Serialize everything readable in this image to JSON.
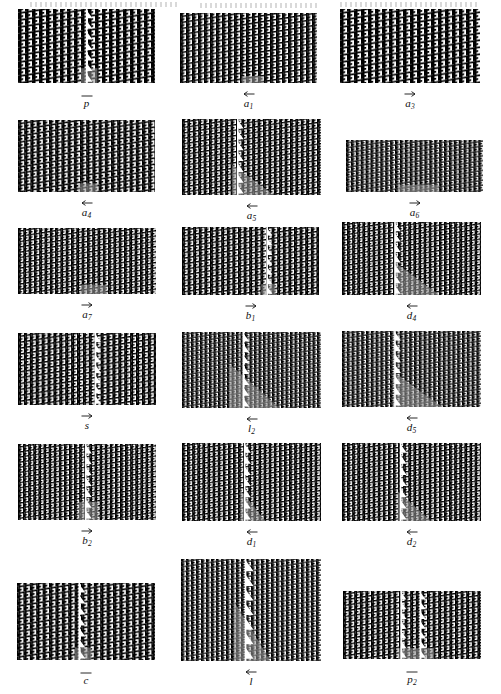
{
  "figure": {
    "type": "tiling-patch-grid",
    "columns": 3,
    "rows": 6,
    "background_color": "#ffffff",
    "tile_color": "#000000",
    "highlight_color": "#9d9d9d",
    "fault_highlight_color": "#b5b5b5",
    "panels": [
      {
        "id": "panel-p-bar",
        "label": "p",
        "subscript": "",
        "accent": "bar",
        "col": 0,
        "row": 0,
        "x": 18,
        "y": 9,
        "w": 137,
        "h": 74,
        "cell": 7.0,
        "fault": {
          "present": true,
          "x_frac": 0.5,
          "style": "vertical-white-triangles"
        },
        "highlight": {
          "present": true,
          "shape": "block",
          "x_frac": 0.46,
          "y_frac": 0.8,
          "w_frac": 0.12,
          "h_frac": 0.2
        }
      },
      {
        "id": "panel-a1",
        "label": "a",
        "subscript": "1",
        "accent": "left",
        "col": 1,
        "row": 0,
        "x": 180,
        "y": 13,
        "w": 137,
        "h": 70,
        "cell": 6.0,
        "fault": {
          "present": false
        },
        "highlight": {
          "present": true,
          "shape": "strip",
          "x_frac": 0.45,
          "y_frac": 0.9,
          "w_frac": 0.16,
          "h_frac": 0.1
        }
      },
      {
        "id": "panel-a3",
        "label": "a",
        "subscript": "3",
        "accent": "right",
        "col": 2,
        "row": 0,
        "x": 340,
        "y": 9,
        "w": 140,
        "h": 74,
        "cell": 7.0,
        "fault": {
          "present": false
        },
        "highlight": {
          "present": false
        }
      },
      {
        "id": "panel-a4",
        "label": "a",
        "subscript": "4",
        "accent": "left",
        "col": 0,
        "row": 1,
        "x": 18,
        "y": 120,
        "w": 137,
        "h": 72,
        "cell": 6.2,
        "fault": {
          "present": false
        },
        "highlight": {
          "present": true,
          "shape": "strip",
          "x_frac": 0.44,
          "y_frac": 0.88,
          "w_frac": 0.14,
          "h_frac": 0.12
        }
      },
      {
        "id": "panel-a5",
        "label": "a",
        "subscript": "5",
        "accent": "left",
        "col": 1,
        "row": 1,
        "x": 182,
        "y": 119,
        "w": 139,
        "h": 76,
        "cell": 5.4,
        "fault": {
          "present": true,
          "x_frac": 0.4,
          "style": "vertical-white-triangles"
        },
        "highlight": {
          "present": true,
          "shape": "triangle",
          "x_frac": 0.36,
          "y_frac": 0.6,
          "w_frac": 0.3,
          "h_frac": 0.4
        }
      },
      {
        "id": "panel-a6",
        "label": "a",
        "subscript": "6",
        "accent": "right",
        "col": 2,
        "row": 1,
        "x": 346,
        "y": 140,
        "w": 137,
        "h": 52,
        "cell": 4.9,
        "fault": {
          "present": false
        },
        "highlight": {
          "present": true,
          "shape": "strip",
          "x_frac": 0.38,
          "y_frac": 0.86,
          "w_frac": 0.3,
          "h_frac": 0.14
        }
      },
      {
        "id": "panel-a7",
        "label": "a",
        "subscript": "7",
        "accent": "right",
        "col": 0,
        "row": 2,
        "x": 18,
        "y": 228,
        "w": 138,
        "h": 66,
        "cell": 5.3,
        "fault": {
          "present": false
        },
        "highlight": {
          "present": true,
          "shape": "strip",
          "x_frac": 0.46,
          "y_frac": 0.86,
          "w_frac": 0.18,
          "h_frac": 0.14
        }
      },
      {
        "id": "panel-b1",
        "label": "b",
        "subscript": "1",
        "accent": "right",
        "col": 1,
        "row": 2,
        "x": 182,
        "y": 227,
        "w": 137,
        "h": 68,
        "cell": 5.6,
        "fault": {
          "present": true,
          "x_frac": 0.62,
          "style": "vertical-white-triangles"
        },
        "highlight": {
          "present": true,
          "shape": "block",
          "x_frac": 0.58,
          "y_frac": 0.84,
          "w_frac": 0.1,
          "h_frac": 0.16
        }
      },
      {
        "id": "panel-d4",
        "label": "d",
        "subscript": "4",
        "accent": "left",
        "col": 2,
        "row": 2,
        "x": 342,
        "y": 222,
        "w": 139,
        "h": 73,
        "cell": 5.1,
        "fault": {
          "present": true,
          "x_frac": 0.38,
          "style": "vertical-white-triangles"
        },
        "highlight": {
          "present": true,
          "shape": "triangle",
          "x_frac": 0.38,
          "y_frac": 0.55,
          "w_frac": 0.32,
          "h_frac": 0.45
        }
      },
      {
        "id": "panel-s",
        "label": "s",
        "subscript": "",
        "accent": "right",
        "col": 0,
        "row": 3,
        "x": 18,
        "y": 333,
        "w": 138,
        "h": 72,
        "cell": 5.9,
        "fault": {
          "present": true,
          "x_frac": 0.56,
          "style": "vertical-white-triangles"
        },
        "highlight": {
          "present": false
        }
      },
      {
        "id": "panel-l2",
        "label": "l",
        "subscript": "2",
        "accent": "left",
        "col": 1,
        "row": 3,
        "x": 182,
        "y": 332,
        "w": 139,
        "h": 76,
        "cell": 4.5,
        "fault": {
          "present": true,
          "x_frac": 0.44,
          "style": "vertical-white-triangles"
        },
        "highlight": {
          "present": true,
          "shape": "triangle",
          "x_frac": 0.34,
          "y_frac": 0.42,
          "w_frac": 0.36,
          "h_frac": 0.58
        }
      },
      {
        "id": "panel-d5",
        "label": "d",
        "subscript": "5",
        "accent": "left",
        "col": 2,
        "row": 3,
        "x": 342,
        "y": 331,
        "w": 139,
        "h": 76,
        "cell": 4.8,
        "fault": {
          "present": true,
          "x_frac": 0.38,
          "style": "vertical-white-triangles"
        },
        "highlight": {
          "present": true,
          "shape": "triangle",
          "x_frac": 0.38,
          "y_frac": 0.55,
          "w_frac": 0.34,
          "h_frac": 0.45
        }
      },
      {
        "id": "panel-b2",
        "label": "b",
        "subscript": "2",
        "accent": "right",
        "col": 0,
        "row": 4,
        "x": 18,
        "y": 444,
        "w": 138,
        "h": 76,
        "cell": 5.1,
        "fault": {
          "present": true,
          "x_frac": 0.49,
          "style": "vertical-white-triangles"
        },
        "highlight": {
          "present": true,
          "shape": "block",
          "x_frac": 0.44,
          "y_frac": 0.76,
          "w_frac": 0.14,
          "h_frac": 0.24
        }
      },
      {
        "id": "panel-d1",
        "label": "d",
        "subscript": "1",
        "accent": "left",
        "col": 1,
        "row": 4,
        "x": 182,
        "y": 443,
        "w": 139,
        "h": 78,
        "cell": 5.1,
        "fault": {
          "present": true,
          "x_frac": 0.45,
          "style": "vertical-white-triangles"
        },
        "highlight": {
          "present": true,
          "shape": "triangle",
          "x_frac": 0.42,
          "y_frac": 0.6,
          "w_frac": 0.18,
          "h_frac": 0.4
        }
      },
      {
        "id": "panel-d2",
        "label": "d",
        "subscript": "2",
        "accent": "left",
        "col": 2,
        "row": 4,
        "x": 342,
        "y": 443,
        "w": 139,
        "h": 78,
        "cell": 5.1,
        "fault": {
          "present": true,
          "x_frac": 0.42,
          "style": "vertical-white-triangles"
        },
        "highlight": {
          "present": true,
          "shape": "triangle",
          "x_frac": 0.4,
          "y_frac": 0.62,
          "w_frac": 0.24,
          "h_frac": 0.38
        }
      },
      {
        "id": "panel-c-bar",
        "label": "c",
        "subscript": "",
        "accent": "bar",
        "col": 0,
        "row": 5,
        "x": 17,
        "y": 583,
        "w": 138,
        "h": 77,
        "cell": 6.4,
        "fault": {
          "present": true,
          "x_frac": 0.45,
          "style": "vertical-white-triangles"
        },
        "highlight": {
          "present": true,
          "shape": "block",
          "x_frac": 0.42,
          "y_frac": 0.84,
          "w_frac": 0.12,
          "h_frac": 0.16
        }
      },
      {
        "id": "panel-l",
        "label": "l",
        "subscript": "",
        "accent": "left",
        "col": 1,
        "row": 5,
        "x": 181,
        "y": 559,
        "w": 140,
        "h": 102,
        "cell": 5.0,
        "fault": {
          "present": true,
          "x_frac": 0.46,
          "style": "vertical-white-triangles"
        },
        "highlight": {
          "present": true,
          "shape": "triangle",
          "x_frac": 0.38,
          "y_frac": 0.42,
          "w_frac": 0.26,
          "h_frac": 0.58
        }
      },
      {
        "id": "panel-p2-bar",
        "label": "p",
        "subscript": "2",
        "accent": "bar",
        "col": 2,
        "row": 5,
        "x": 343,
        "y": 591,
        "w": 138,
        "h": 68,
        "cell": 5.6,
        "fault": {
          "present": true,
          "x_frac": 0.42,
          "style": "vertical-white-triangles-double"
        },
        "highlight": {
          "present": true,
          "shape": "strip",
          "x_frac": 0.4,
          "y_frac": 0.84,
          "w_frac": 0.26,
          "h_frac": 0.16
        }
      }
    ]
  }
}
